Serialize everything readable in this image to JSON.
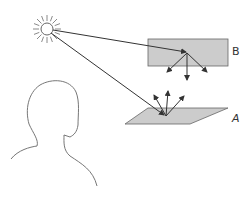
{
  "diagram": {
    "labels": {
      "surface_a": "A",
      "surface_b": "B"
    },
    "elements": {
      "light_source": "sun-icon",
      "viewer": "head-silhouette",
      "surface_a": "horizontal parallelogram (gray)",
      "surface_b": "vertical rectangle (gray)"
    },
    "colors": {
      "surface_fill": "#cccccc",
      "stroke": "#555555",
      "sun_stroke": "#888888",
      "background": "#ffffff"
    }
  }
}
